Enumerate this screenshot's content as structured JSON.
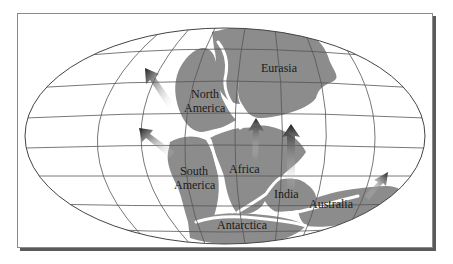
{
  "figure": {
    "type": "map-diagram",
    "projection": "elliptical world map"
  },
  "colors": {
    "land": "#8c8c8c",
    "grid": "#555555",
    "ocean": "#ffffff",
    "rift": "#ffffff",
    "arrow_dark": "#1e1e1e",
    "frame_shadow": "#5a5a5a"
  },
  "labels": {
    "eurasia": "Eurasia",
    "north_america_1": "North",
    "north_america_2": "America",
    "south_america_1": "South",
    "south_america_2": "America",
    "africa": "Africa",
    "india": "India",
    "australia": "Australia",
    "antarctica": "Antarctica"
  },
  "arrows": [
    {
      "name": "north-america-motion",
      "direction": "northwest"
    },
    {
      "name": "south-america-motion",
      "direction": "northwest"
    },
    {
      "name": "africa-motion",
      "direction": "north"
    },
    {
      "name": "india-motion",
      "direction": "north"
    },
    {
      "name": "australia-motion",
      "direction": "northeast"
    }
  ]
}
